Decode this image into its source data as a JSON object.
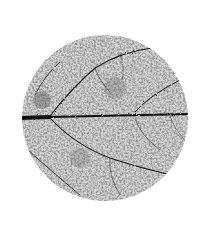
{
  "image": {
    "subject": "leaf skeleton vein texture in circular crop",
    "background_color": "#ffffff",
    "vein_color": "#111111",
    "texture_color": "#6f6f6f",
    "circle": {
      "cx": 105,
      "cy": 118,
      "r": 83
    }
  }
}
